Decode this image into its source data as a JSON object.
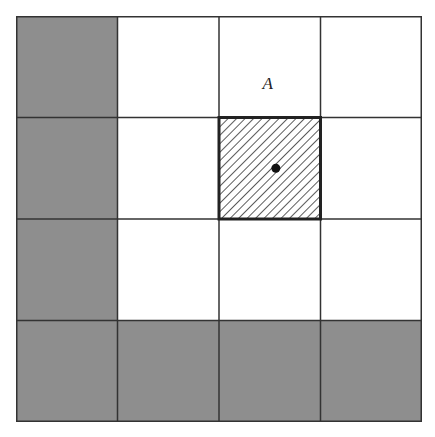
{
  "diagram": {
    "rows": 4,
    "cols": 4,
    "colors": {
      "shaded": "#8e8e8e",
      "empty": "#ffffff",
      "line": "#333333",
      "hatch": "#333333",
      "dot": "#111111"
    },
    "cells": [
      [
        "shaded",
        "empty",
        "empty",
        "empty"
      ],
      [
        "shaded",
        "empty",
        "hatched",
        "empty"
      ],
      [
        "shaded",
        "empty",
        "empty",
        "empty"
      ],
      [
        "shaded",
        "shaded",
        "shaded",
        "shaded"
      ]
    ],
    "label": {
      "text": "A",
      "row": 0,
      "col": 2
    },
    "highlight": {
      "row": 1,
      "col": 2,
      "pattern": "diagonal-hatch",
      "has_dot": true
    }
  }
}
